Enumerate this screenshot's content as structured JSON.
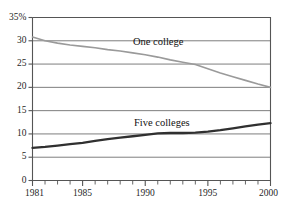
{
  "chart_data": {
    "type": "line",
    "title": "",
    "xlabel": "",
    "ylabel": "",
    "xlim": [
      1981,
      2000
    ],
    "ylim": [
      0,
      35
    ],
    "grid": true,
    "grid_axis": "y",
    "legend_position": "inline-labels",
    "y_ticks": [
      0,
      5,
      10,
      15,
      20,
      25,
      30,
      35
    ],
    "y_tick_labels": [
      "0",
      "5",
      "10",
      "15",
      "20",
      "25",
      "30",
      "35%"
    ],
    "x_ticks": [
      1981,
      1985,
      1990,
      1995,
      2000
    ],
    "x_tick_labels": [
      "1981",
      "1985",
      "1990",
      "1995",
      "2000"
    ],
    "x_minor_ticks": [
      1981,
      1982,
      1983,
      1984,
      1985,
      1986,
      1987,
      1988,
      1989,
      1990,
      1991,
      1992,
      1993,
      1994,
      1995,
      1996,
      1997,
      1998,
      1999,
      2000
    ],
    "x": [
      1981,
      1982,
      1983,
      1984,
      1985,
      1986,
      1987,
      1988,
      1989,
      1990,
      1991,
      1992,
      1993,
      1994,
      1995,
      1996,
      1997,
      1998,
      1999,
      2000
    ],
    "series": [
      {
        "name": "One college",
        "color": "#9a9a9a",
        "line_width": 1.6,
        "values": [
          30.8,
          30.0,
          29.5,
          29.1,
          28.8,
          28.5,
          28.1,
          27.8,
          27.4,
          27.0,
          26.5,
          25.9,
          25.4,
          24.9,
          24.0,
          23.1,
          22.3,
          21.5,
          20.7,
          20.0
        ]
      },
      {
        "name": "Five colleges",
        "color": "#303030",
        "line_width": 2.3,
        "values": [
          7.0,
          7.2,
          7.5,
          7.8,
          8.1,
          8.5,
          8.9,
          9.2,
          9.5,
          9.8,
          10.1,
          10.2,
          10.2,
          10.3,
          10.5,
          10.8,
          11.2,
          11.6,
          12.0,
          12.3
        ]
      }
    ],
    "annotations": [
      {
        "text": "One college",
        "x": 1990.5,
        "y": 28.8
      },
      {
        "text": "Five colleges",
        "x": 1990.6,
        "y": 11.6
      }
    ]
  },
  "axes": {
    "frame_color": "#555555",
    "gridline_color": "#6f6f6f"
  }
}
